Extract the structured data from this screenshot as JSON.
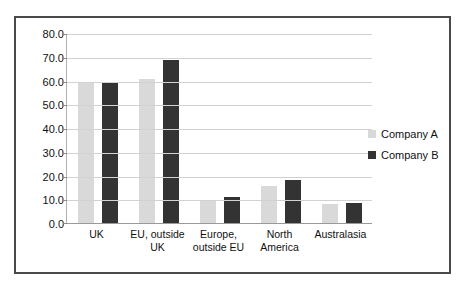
{
  "top_caption": "",
  "chart_data": {
    "type": "bar",
    "title": "",
    "subtitle": "",
    "xlabel": "",
    "ylabel": "",
    "ylim": [
      0,
      80
    ],
    "ytick_step": 10,
    "grid": true,
    "legend_position": "right",
    "ytick_labels": [
      "80.0",
      "70.0",
      "60.0",
      "50.0",
      "40.0",
      "30.0",
      "20.0",
      "10.0",
      "0.0"
    ],
    "ytick_values": [
      80,
      70,
      60,
      50,
      40,
      30,
      20,
      10,
      0
    ],
    "categories": [
      "UK",
      "EU, outside UK",
      "Europe, outside EU",
      "North America",
      "Australasia"
    ],
    "series": [
      {
        "name": "Company A",
        "color": "#d9d9d9",
        "values": [
          60.0,
          61.0,
          10.0,
          16.0,
          8.5
        ]
      },
      {
        "name": "Company B",
        "color": "#333333",
        "values": [
          60.0,
          69.0,
          11.5,
          18.5,
          9.0
        ]
      }
    ]
  }
}
